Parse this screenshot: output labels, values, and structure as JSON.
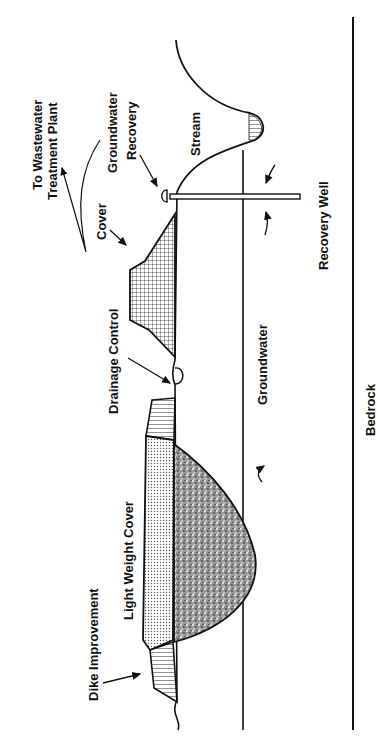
{
  "diagram": {
    "orientation": "rotated-90-ccw",
    "labels": {
      "to_wastewater_1": "To Wastewater",
      "to_wastewater_2": "Treatment Plant",
      "groundwater_recovery_1": "Groundwater",
      "groundwater_recovery_2": "Recovery",
      "stream": "Stream",
      "cover": "Cover",
      "recovery_well": "Recovery Well",
      "drainage_control": "Drainage Control",
      "groundwater": "Groundwater",
      "bedrock": "Bedrock",
      "light_weight_cover": "Light Weight Cover",
      "dike_improvement": "Dike Improvement"
    },
    "colors": {
      "ink": "#111111",
      "background": "#ffffff"
    }
  }
}
